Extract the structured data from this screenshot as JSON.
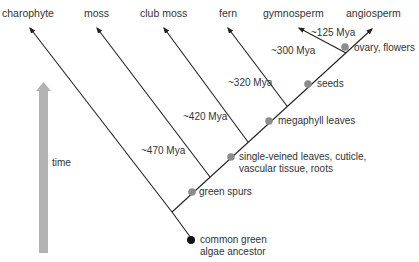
{
  "taxa": [
    {
      "label": "charophyte",
      "x": 2,
      "y": 7
    },
    {
      "label": "moss",
      "x": 84,
      "y": 7
    },
    {
      "label": "club moss",
      "x": 140,
      "y": 7
    },
    {
      "label": "fern",
      "x": 219,
      "y": 7
    },
    {
      "label": "gymnosperm",
      "x": 263,
      "y": 7
    },
    {
      "label": "angiosperm",
      "x": 346,
      "y": 7
    }
  ],
  "divergence_times": [
    {
      "label": "~470 Mya",
      "x": 141,
      "y": 145
    },
    {
      "label": "~420 Mya",
      "x": 183,
      "y": 111
    },
    {
      "label": "~320 Mya",
      "x": 228,
      "y": 77
    },
    {
      "label": "~300 Mya",
      "x": 271,
      "y": 45
    },
    {
      "label": "~125 Mya",
      "x": 311,
      "y": 27
    }
  ],
  "traits": [
    {
      "label": "green spurs",
      "x": 199,
      "y": 186
    },
    {
      "label": "single-veined leaves, cuticle,",
      "x": 239,
      "y": 151
    },
    {
      "label": "vascular tissue, roots",
      "x": 239,
      "y": 163
    },
    {
      "label": "megaphyll leaves",
      "x": 278,
      "y": 115
    },
    {
      "label": "seeds",
      "x": 317,
      "y": 78
    },
    {
      "label": "ovary, flowers",
      "x": 354,
      "y": 42
    }
  ],
  "ancestor": {
    "line1": "common green",
    "line2": "algae ancestor"
  },
  "time_axis": {
    "label": "time"
  },
  "colors": {
    "line": "#222222",
    "node": "#8c8c8c",
    "root": "#111111",
    "arrow": "#b3b3b3"
  }
}
